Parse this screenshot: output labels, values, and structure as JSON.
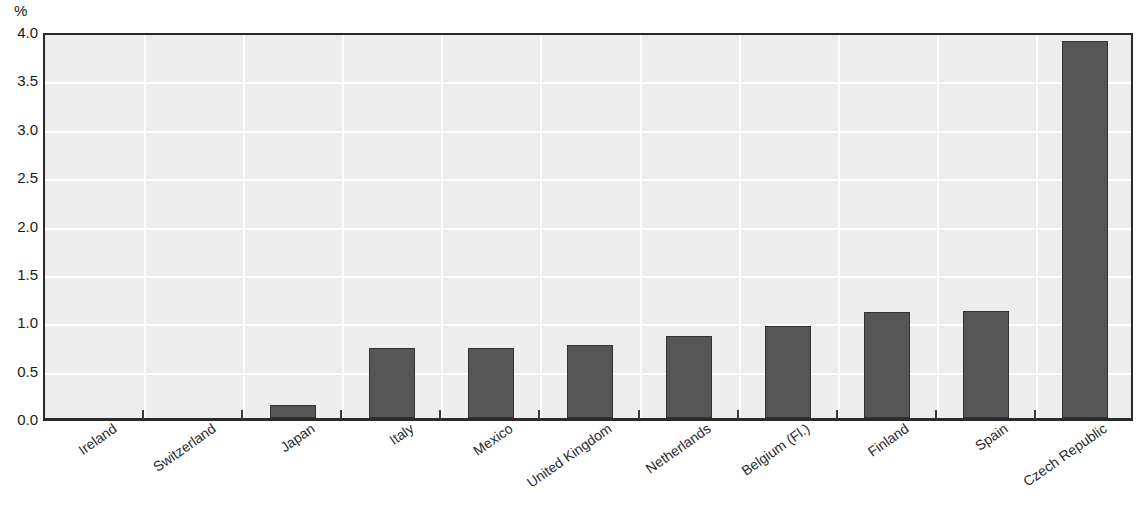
{
  "chart_data": {
    "type": "bar",
    "title": "",
    "subtitle": "",
    "xlabel": "",
    "ylabel": "%",
    "unit_label": "%",
    "ylim": [
      0.0,
      4.0
    ],
    "ytick_step": 0.5,
    "ytick_labels": [
      "0.0",
      "0.5",
      "1.0",
      "1.5",
      "2.0",
      "2.5",
      "3.0",
      "3.5",
      "4.0"
    ],
    "ytick_values": [
      0.0,
      0.5,
      1.0,
      1.5,
      2.0,
      2.5,
      3.0,
      3.5,
      4.0
    ],
    "grid": "horizontal-and-vertical",
    "legend": "none",
    "categories": [
      "Ireland",
      "Switzerland",
      "Japan",
      "Italy",
      "Mexico",
      "United Kingdom",
      "Netherlands",
      "Belgium (Fl.)",
      "Finland",
      "Spain",
      "Czech Republic"
    ],
    "values": [
      0.0,
      0.0,
      0.13,
      0.72,
      0.72,
      0.75,
      0.85,
      0.95,
      1.1,
      1.11,
      3.9
    ],
    "series": [
      {
        "name": "",
        "values": [
          0.0,
          0.0,
          0.13,
          0.72,
          0.72,
          0.75,
          0.85,
          0.95,
          1.1,
          1.11,
          3.9
        ]
      }
    ],
    "colors": {
      "bar_fill": "#555555",
      "bar_border": "#333333",
      "plot_background": "#ededed",
      "gridline": "#fdfdfd",
      "axis": "#2b2b2b",
      "text": "#1a1a1a"
    }
  }
}
